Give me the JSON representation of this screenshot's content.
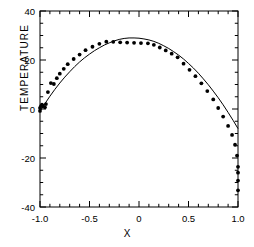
{
  "chart_data": {
    "type": "scatter",
    "title": "",
    "xlabel": "X",
    "ylabel": "TEMPERATURE",
    "xlim": [
      -1.0,
      1.0
    ],
    "ylim": [
      -40,
      40
    ],
    "xticks": [
      -1.0,
      -0.5,
      0,
      0.5,
      1.0
    ],
    "xticklabels": [
      "-1.0",
      "-0.5",
      "0",
      "0.5",
      "1.0"
    ],
    "yticks": [
      -40,
      -20,
      0,
      20,
      40
    ],
    "yticklabels": [
      "-40",
      "-20",
      "0",
      "20",
      "40"
    ],
    "x_minor_step": 0.1,
    "y_minor_step": 5,
    "grid": false,
    "legend": null,
    "series": [
      {
        "name": "fitted curve",
        "type": "line",
        "x": [
          -1.0,
          -0.95,
          -0.9,
          -0.85,
          -0.8,
          -0.75,
          -0.7,
          -0.65,
          -0.6,
          -0.55,
          -0.5,
          -0.45,
          -0.4,
          -0.35,
          -0.3,
          -0.25,
          -0.2,
          -0.15,
          -0.1,
          -0.05,
          0.0,
          0.05,
          0.1,
          0.15,
          0.2,
          0.25,
          0.3,
          0.35,
          0.4,
          0.45,
          0.5,
          0.55,
          0.6,
          0.65,
          0.7,
          0.75,
          0.8,
          0.85,
          0.9,
          0.95,
          1.0
        ],
        "y": [
          -1.0,
          2.2,
          5.2,
          8.0,
          10.6,
          13.0,
          15.2,
          17.3,
          19.2,
          20.9,
          22.4,
          23.8,
          25.0,
          26.1,
          27.0,
          27.8,
          28.4,
          28.8,
          29.0,
          29.0,
          28.9,
          28.6,
          28.2,
          27.6,
          26.8,
          25.8,
          24.7,
          23.4,
          22.0,
          20.4,
          18.6,
          16.7,
          14.6,
          12.3,
          9.9,
          7.3,
          4.6,
          1.7,
          -1.4,
          -4.6,
          -8.0
        ]
      },
      {
        "name": "measured data",
        "type": "scatter",
        "marker": "filled-circle",
        "x": [
          -1.0,
          -1.0,
          -0.99,
          -0.98,
          -0.97,
          -0.95,
          -0.94,
          -0.92,
          -0.89,
          -0.86,
          -0.83,
          -0.8,
          -0.76,
          -0.72,
          -0.66,
          -0.6,
          -0.54,
          -0.47,
          -0.4,
          -0.33,
          -0.26,
          -0.19,
          -0.12,
          -0.05,
          0.02,
          0.09,
          0.15,
          0.21,
          0.27,
          0.33,
          0.39,
          0.45,
          0.51,
          0.57,
          0.63,
          0.69,
          0.75,
          0.8,
          0.85,
          0.9,
          0.94,
          0.97,
          0.99,
          1.0,
          1.0,
          1.0,
          1.0
        ],
        "y": [
          -0.8,
          0.4,
          1.2,
          1.8,
          1.3,
          0.7,
          2.0,
          6.9,
          10.6,
          10.2,
          12.6,
          14.4,
          16.4,
          18.3,
          20.4,
          22.2,
          24.0,
          25.4,
          26.6,
          27.5,
          27.4,
          27.2,
          27.1,
          27.0,
          26.9,
          26.8,
          26.2,
          25.1,
          23.9,
          22.6,
          21.1,
          18.5,
          16.0,
          13.4,
          10.5,
          7.3,
          3.9,
          0.4,
          -3.1,
          -6.9,
          -10.6,
          -14.6,
          -19.0,
          -23.6,
          -26.0,
          -29.2,
          -33.2
        ]
      }
    ]
  },
  "figure": {
    "frame_color": "#000000",
    "line_color": "#000000",
    "marker_color": "#000000",
    "background": "#ffffff"
  }
}
